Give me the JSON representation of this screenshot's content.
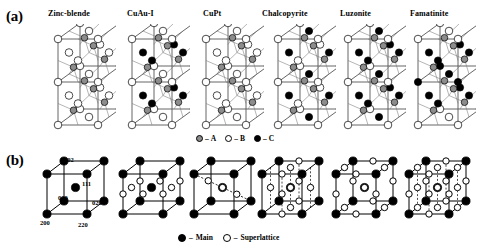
{
  "figure": {
    "panels": [
      {
        "id": "a",
        "label": "(a)"
      },
      {
        "id": "b",
        "label": "(b)"
      }
    ]
  },
  "structures": {
    "column_titles": [
      "Zinc-blende",
      "CuAu-I",
      "CuPt",
      "Chalcopyrite",
      "Luzonite",
      "Famatinite"
    ]
  },
  "legend_a": {
    "items": [
      {
        "symbol": "gray-filled-circle",
        "dash": "–",
        "label": "A"
      },
      {
        "symbol": "open-circle",
        "dash": "–",
        "label": "B"
      },
      {
        "symbol": "black-filled-circle",
        "dash": "–",
        "label": "C"
      }
    ]
  },
  "legend_b": {
    "items": [
      {
        "symbol": "black-filled-circle",
        "dash": "–",
        "label": "Main"
      },
      {
        "symbol": "open-circle",
        "dash": "–",
        "label": "Superlattice"
      }
    ]
  },
  "miller_indices": {
    "top": "002",
    "center": "111",
    "origin": "000",
    "right": "020",
    "bottom_left": "200",
    "bottom_right": "220"
  },
  "colors": {
    "atom_a": "#8c8c8c",
    "atom_b": "#ffffff",
    "atom_c": "#000000",
    "spot_main": "#000000",
    "spot_superlattice": "#ffffff",
    "outline": "#000000",
    "cell_edge": "#555555",
    "background": "#ffffff"
  }
}
